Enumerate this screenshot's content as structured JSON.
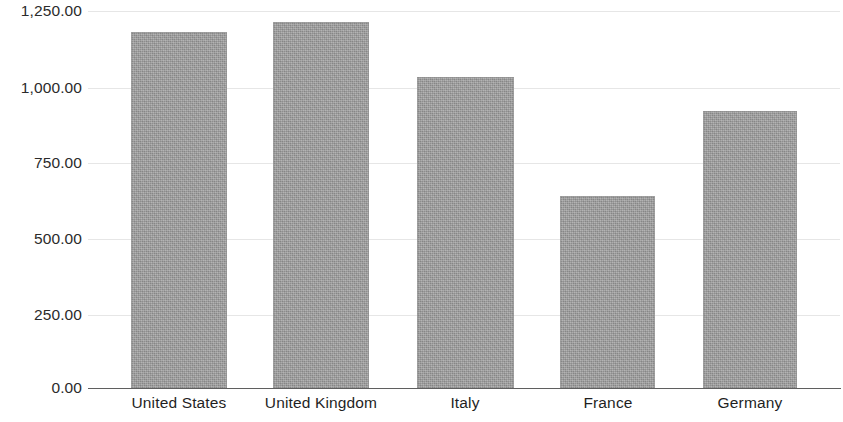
{
  "chart_data": {
    "type": "bar",
    "title": "",
    "subtitle": "",
    "xlabel": "",
    "ylabel": "",
    "categories": [
      "United States",
      "United Kingdom",
      "Italy",
      "France",
      "Germany"
    ],
    "values": [
      1184,
      1217,
      1035,
      640,
      922
    ],
    "ylim": [
      0,
      1250
    ],
    "ytick_values": [
      1250,
      1000,
      750,
      500,
      250,
      0
    ],
    "ytick_labels": [
      "1,250.00",
      "1,000.00",
      "750.00",
      "500.00",
      "250.00",
      "0.00"
    ],
    "grid": true,
    "grid_axis": "y",
    "legend": false,
    "legend_position": "none",
    "bar_color": "#9b9b9b",
    "gridline_color": "#e2e2e2",
    "axis_color": "#5f5f5f",
    "background_color": "#ffffff",
    "text_color": "#1f1f1f",
    "annotations": []
  },
  "axis": {
    "y": {
      "ticks": [
        {
          "label": "1,250.00",
          "value": 1250
        },
        {
          "label": "1,000.00",
          "value": 1000
        },
        {
          "label": "750.00",
          "value": 750
        },
        {
          "label": "500.00",
          "value": 500
        },
        {
          "label": "250.00",
          "value": 250
        },
        {
          "label": "0.00",
          "value": 0
        }
      ]
    },
    "x": {
      "ticks": [
        {
          "label": "United States"
        },
        {
          "label": "United Kingdom"
        },
        {
          "label": "Italy"
        },
        {
          "label": "France"
        },
        {
          "label": "Germany"
        }
      ]
    }
  },
  "series": [
    {
      "name": "",
      "bars": [
        {
          "category": "United States",
          "value": 1184
        },
        {
          "category": "United Kingdom",
          "value": 1217
        },
        {
          "category": "Italy",
          "value": 1035
        },
        {
          "category": "France",
          "value": 640
        },
        {
          "category": "Germany",
          "value": 922
        }
      ]
    }
  ]
}
